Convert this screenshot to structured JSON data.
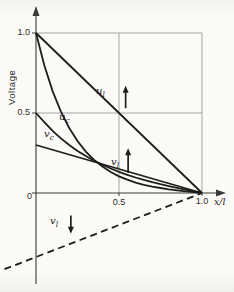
{
  "figure": {
    "background": "#fbfaf7",
    "ink_color": "#1d1d1b",
    "grid_color": "#9b9b98",
    "axis_color": "#3a3a38"
  },
  "axes": {
    "y_label": "Voltage",
    "x_label": "x/l",
    "y_ticks": [
      "1.0",
      "0.5",
      "0"
    ],
    "x_ticks": [
      "0.5",
      "1.0"
    ]
  },
  "chart_data": {
    "type": "line",
    "title": "",
    "xlabel": "x/l",
    "ylabel": "Voltage",
    "xlim": [
      -0.22,
      1.14
    ],
    "ylim": [
      -0.58,
      1.16
    ],
    "grid": {
      "x": [
        0.5,
        1.0
      ],
      "y": [
        0.5,
        1.0
      ]
    },
    "x_tick_values": [
      0.5,
      1.0
    ],
    "y_tick_values": [
      1.0,
      0.5,
      0
    ],
    "legend": "none",
    "series": [
      {
        "name": "u_l",
        "label_base": "u",
        "label_sub": "l",
        "style": "solid",
        "points": [
          [
            0,
            1
          ],
          [
            1,
            0
          ]
        ]
      },
      {
        "name": "u_c",
        "label_base": "u",
        "label_sub": "c",
        "style": "solid",
        "points": [
          [
            0,
            1
          ],
          [
            0.05,
            0.798
          ],
          [
            0.1,
            0.637
          ],
          [
            0.15,
            0.508
          ],
          [
            0.2,
            0.406
          ],
          [
            0.25,
            0.325
          ],
          [
            0.3,
            0.259
          ],
          [
            0.35,
            0.207
          ],
          [
            0.4,
            0.165
          ],
          [
            0.45,
            0.131
          ],
          [
            0.5,
            0.104
          ],
          [
            0.55,
            0.083
          ],
          [
            0.6,
            0.065
          ],
          [
            0.65,
            0.051
          ],
          [
            0.7,
            0.04
          ],
          [
            0.75,
            0.031
          ],
          [
            0.8,
            0.023
          ],
          [
            0.85,
            0.016
          ],
          [
            0.9,
            0.01
          ],
          [
            0.95,
            0.005
          ],
          [
            1,
            0
          ]
        ]
      },
      {
        "name": "v_c",
        "label_base": "v",
        "label_sub": "c",
        "style": "solid",
        "points": [
          [
            0,
            0.5
          ],
          [
            0.05,
            0.443
          ],
          [
            0.1,
            0.388
          ],
          [
            0.15,
            0.341
          ],
          [
            0.2,
            0.3
          ],
          [
            0.25,
            0.263
          ],
          [
            0.3,
            0.231
          ],
          [
            0.35,
            0.202
          ],
          [
            0.4,
            0.176
          ],
          [
            0.45,
            0.153
          ],
          [
            0.5,
            0.132
          ],
          [
            0.55,
            0.114
          ],
          [
            0.6,
            0.097
          ],
          [
            0.65,
            0.082
          ],
          [
            0.7,
            0.068
          ],
          [
            0.75,
            0.055
          ],
          [
            0.8,
            0.043
          ],
          [
            0.85,
            0.032
          ],
          [
            0.9,
            0.021
          ],
          [
            0.95,
            0.01
          ],
          [
            1,
            0
          ]
        ]
      },
      {
        "name": "v_l",
        "label_base": "v",
        "label_sub": "l",
        "style": "solid",
        "points": [
          [
            0,
            0.3
          ],
          [
            1,
            0
          ]
        ]
      },
      {
        "name": "v_l_negative",
        "label_base": "v",
        "label_sub": "l",
        "style": "dashed",
        "points": [
          [
            -0.19,
            -0.476
          ],
          [
            1,
            0
          ]
        ]
      }
    ],
    "annotations": [
      {
        "name": "u_l-direction-arrow",
        "glyph": "↑",
        "dir": "up",
        "x": 0.54,
        "y_from": 0.53,
        "y_to": 0.67
      },
      {
        "name": "v_l-direction-arrow",
        "glyph": "↑",
        "dir": "up",
        "x": 0.555,
        "y_from": 0.125,
        "y_to": 0.28
      },
      {
        "name": "v_l-negative-direction-arrow",
        "glyph": "↓",
        "dir": "down",
        "x": 0.21,
        "y_from": -0.14,
        "y_to": -0.255
      }
    ]
  }
}
